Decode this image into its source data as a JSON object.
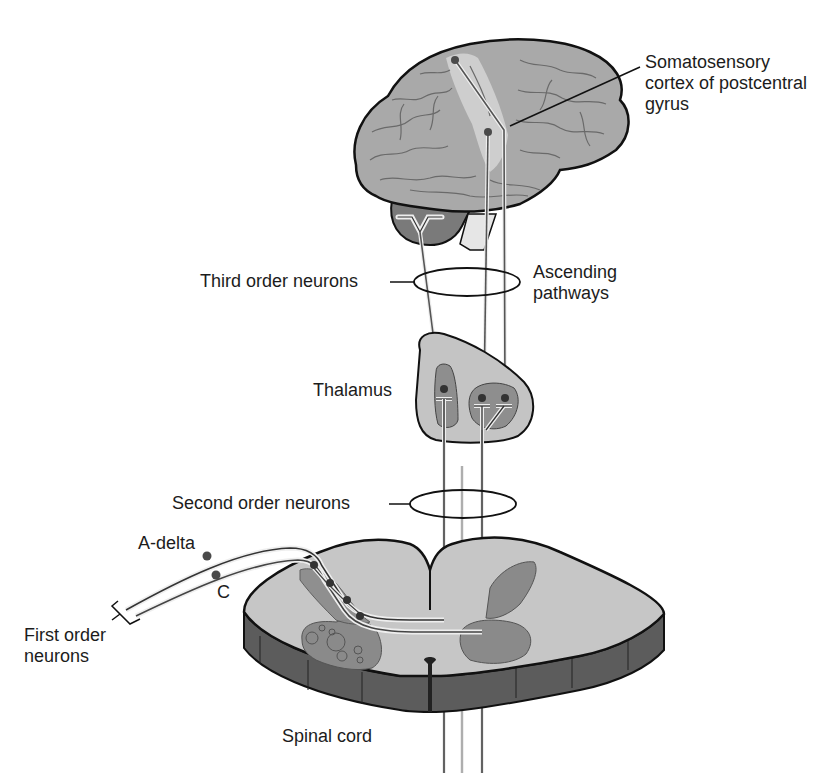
{
  "diagram": {
    "type": "anatomical-pathway"
  },
  "labels": {
    "somatosensory_cortex": [
      "Somatosensory",
      "cortex of postcentral",
      "gyrus"
    ],
    "third_order": "Third order neurons",
    "ascending": [
      "Ascending",
      "pathways"
    ],
    "thalamus": "Thalamus",
    "second_order": "Second order neurons",
    "a_delta": "A-delta",
    "c_fiber": "C",
    "first_order": [
      "First order",
      "neurons"
    ],
    "spinal_cord": "Spinal cord"
  },
  "colors": {
    "brain_fill": "#a9a9a9",
    "cortex_strip": "#d2d2d2",
    "cerebellum": "#7a7a7a",
    "thalamus_fill": "#c4c4c4",
    "thalamus_nucleus": "#8e8e8e",
    "cord_white_matter": "#c6c6c6",
    "cord_gray_matter": "#8a8a8a",
    "cord_side": "#5c5c5c",
    "outline": "#111111",
    "fiber": "#444444",
    "neuron_dot": "#4a4a4a"
  }
}
